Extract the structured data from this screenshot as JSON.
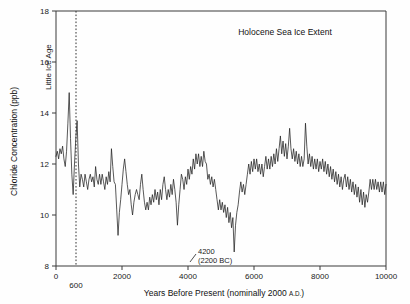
{
  "chart_data": {
    "type": "line",
    "title": "Holocene Sea Ice Extent",
    "xlabel": "Years Before Present (nominally 2000 A.D.)",
    "xlabel_main": "Years Before Present (nominally 2000 ",
    "xlabel_smallcaps": "A.D.",
    "xlabel_tail": ")",
    "ylabel": "Chloride Concentration (ppb)",
    "xlim": [
      0,
      10000
    ],
    "ylim": [
      8,
      18
    ],
    "xticks": [
      0,
      2000,
      4000,
      6000,
      8000,
      10000
    ],
    "xtick_labels": [
      "0",
      "2000",
      "4000",
      "6000",
      "8000",
      "10000"
    ],
    "yticks": [
      8,
      10,
      12,
      14,
      16,
      18
    ],
    "ytick_labels": [
      "8",
      "10",
      "12",
      "14",
      "16",
      "18"
    ],
    "grid": false,
    "legend": null,
    "series_name": "Chloride Concentration",
    "line_color": "#222222",
    "annotations": [
      {
        "name": "little-ice-age",
        "label": "Little Ice Age",
        "marker_x": 600,
        "marker_label": "600",
        "style": "vertical dotted line with rotated label"
      },
      {
        "name": "event-4200",
        "label_line1": "4200",
        "label_line2": "(2200 BC)",
        "point_x": 4200,
        "point_y": 8.55,
        "style": "leader line to minimum"
      }
    ],
    "x": [
      0,
      40,
      80,
      120,
      160,
      200,
      240,
      280,
      320,
      360,
      400,
      440,
      480,
      520,
      560,
      600,
      640,
      680,
      720,
      760,
      800,
      840,
      880,
      920,
      960,
      1000,
      1040,
      1080,
      1120,
      1160,
      1200,
      1240,
      1280,
      1320,
      1360,
      1400,
      1440,
      1480,
      1520,
      1560,
      1600,
      1640,
      1680,
      1720,
      1760,
      1800,
      1840,
      1880,
      1920,
      1960,
      2000,
      2040,
      2080,
      2120,
      2160,
      2200,
      2240,
      2280,
      2320,
      2360,
      2400,
      2440,
      2480,
      2520,
      2560,
      2600,
      2640,
      2680,
      2720,
      2760,
      2800,
      2840,
      2880,
      2920,
      2960,
      3000,
      3040,
      3080,
      3120,
      3160,
      3200,
      3240,
      3280,
      3320,
      3360,
      3400,
      3440,
      3480,
      3520,
      3560,
      3600,
      3640,
      3680,
      3720,
      3760,
      3800,
      3840,
      3880,
      3920,
      3960,
      4000,
      4040,
      4080,
      4120,
      4160,
      4200,
      4240,
      4280,
      4320,
      4360,
      4400,
      4440,
      4480,
      4520,
      4560,
      4600,
      4640,
      4680,
      4720,
      4760,
      4800,
      4840,
      4880,
      4920,
      4960,
      5000,
      5040,
      5080,
      5120,
      5160,
      5200,
      5240,
      5280,
      5320,
      5360,
      5400,
      5440,
      5480,
      5520,
      5560,
      5600,
      5640,
      5680,
      5720,
      5760,
      5800,
      5840,
      5880,
      5920,
      5960,
      6000,
      6040,
      6080,
      6120,
      6160,
      6200,
      6240,
      6280,
      6320,
      6360,
      6400,
      6440,
      6480,
      6520,
      6560,
      6600,
      6640,
      6680,
      6720,
      6760,
      6800,
      6840,
      6880,
      6920,
      6960,
      7000,
      7040,
      7080,
      7120,
      7160,
      7200,
      7240,
      7280,
      7320,
      7360,
      7400,
      7440,
      7480,
      7520,
      7560,
      7600,
      7640,
      7680,
      7720,
      7760,
      7800,
      7840,
      7880,
      7920,
      7960,
      8000,
      8040,
      8080,
      8120,
      8160,
      8200,
      8240,
      8280,
      8320,
      8360,
      8400,
      8440,
      8480,
      8520,
      8560,
      8600,
      8640,
      8680,
      8720,
      8760,
      8800,
      8840,
      8880,
      8920,
      8960,
      9000,
      9040,
      9080,
      9120,
      9160,
      9200,
      9240,
      9280,
      9320,
      9360,
      9400,
      9440,
      9480,
      9520,
      9560,
      9600,
      9640,
      9680,
      9720,
      9760,
      9800,
      9840,
      9880,
      9920,
      9960,
      10000
    ],
    "y": [
      12.3,
      12.5,
      12.2,
      12.6,
      12.4,
      12.7,
      12.2,
      11.9,
      12.5,
      13.6,
      14.8,
      13.0,
      11.6,
      10.8,
      12.0,
      13.0,
      13.7,
      12.0,
      11.1,
      11.6,
      11.4,
      11.1,
      11.6,
      11.3,
      11.0,
      11.4,
      11.6,
      11.3,
      11.5,
      11.1,
      11.9,
      11.4,
      11.2,
      11.6,
      11.2,
      11.6,
      11.3,
      11.0,
      11.5,
      11.2,
      11.7,
      11.3,
      12.6,
      11.9,
      11.3,
      11.2,
      10.2,
      9.2,
      10.1,
      10.6,
      11.2,
      11.8,
      12.2,
      11.7,
      11.2,
      10.8,
      11.0,
      10.4,
      10.0,
      10.5,
      10.8,
      11.0,
      10.8,
      10.6,
      11.2,
      11.6,
      11.0,
      10.5,
      10.2,
      10.5,
      10.2,
      10.7,
      10.4,
      10.8,
      10.5,
      11.0,
      10.6,
      10.9,
      10.4,
      11.0,
      10.6,
      11.2,
      11.5,
      11.0,
      10.6,
      11.0,
      10.7,
      11.2,
      10.8,
      11.4,
      11.0,
      10.5,
      9.6,
      10.4,
      11.0,
      11.6,
      11.4,
      11.0,
      11.5,
      11.2,
      11.8,
      11.4,
      11.9,
      11.6,
      12.2,
      11.8,
      12.4,
      12.0,
      12.4,
      11.9,
      12.3,
      11.9,
      12.5,
      12.1,
      12.0,
      11.4,
      11.6,
      11.2,
      11.5,
      11.1,
      11.4,
      11.0,
      10.6,
      10.2,
      10.6,
      10.2,
      10.5,
      10.1,
      10.4,
      9.9,
      10.3,
      9.7,
      10.1,
      9.5,
      9.9,
      8.55,
      9.6,
      10.1,
      10.4,
      10.9,
      11.3,
      10.9,
      11.2,
      10.8,
      11.2,
      11.6,
      12.0,
      11.6,
      12.1,
      11.7,
      12.2,
      11.8,
      12.2,
      11.7,
      12.0,
      11.6,
      12.0,
      11.5,
      11.9,
      12.3,
      11.8,
      12.2,
      11.8,
      12.3,
      11.9,
      12.4,
      12.0,
      12.6,
      12.1,
      12.6,
      13.1,
      12.4,
      12.9,
      12.3,
      12.8,
      12.2,
      12.7,
      13.4,
      12.6,
      12.2,
      12.6,
      12.1,
      12.5,
      12.0,
      12.4,
      11.9,
      12.3,
      11.9,
      12.2,
      13.6,
      12.7,
      12.0,
      12.4,
      11.9,
      12.3,
      11.8,
      12.2,
      11.8,
      12.2,
      11.7,
      12.1,
      11.8,
      12.2,
      11.7,
      12.1,
      11.6,
      12.0,
      11.5,
      11.9,
      11.4,
      11.8,
      11.3,
      11.7,
      11.2,
      11.6,
      11.1,
      11.5,
      11.0,
      11.4,
      11.6,
      11.1,
      11.5,
      11.0,
      11.4,
      10.9,
      11.3,
      10.8,
      11.2,
      10.7,
      11.1,
      10.5,
      11.0,
      10.4,
      10.9,
      10.3,
      10.8,
      10.5,
      10.9,
      11.4,
      11.0,
      11.4,
      11.0,
      11.4,
      11.0,
      11.3,
      10.9,
      11.3,
      10.9,
      11.3,
      10.8,
      11.2,
      11.5,
      11.0,
      11.4,
      10.9,
      11.4,
      11.0,
      11.5,
      11.1,
      11.6,
      11.1,
      11.6,
      11.2,
      11.7,
      11.3,
      11.8,
      11.3,
      11.8,
      11.4,
      11.8,
      11.4,
      11.9,
      11.4,
      11.9,
      11.5,
      12.0,
      11.5,
      12.0,
      11.6,
      12.1,
      11.6,
      12.1,
      11.7,
      12.2,
      11.7,
      12.2,
      11.8,
      12.3,
      11.8,
      12.3,
      11.9,
      12.4,
      11.9,
      12.4,
      12.0,
      12.5,
      12.0,
      12.5,
      12.1,
      12.6,
      12.1,
      12.6,
      12.2,
      12.7,
      12.2,
      12.7,
      12.3,
      12.8,
      12.3,
      12.8,
      12.4,
      12.9,
      12.4,
      12.9,
      12.5,
      13.0,
      12.5,
      13.0,
      12.6,
      13.1,
      12.6,
      12.4,
      12.8,
      12.5,
      12.9,
      12.6,
      13.0,
      12.7,
      13.2,
      12.9,
      13.4,
      13.0,
      13.6,
      13.2,
      13.0,
      13.4,
      13.1,
      12.8,
      13.2,
      12.9,
      12.6,
      12.9,
      12.5,
      12.1,
      12.4,
      12.0,
      11.7,
      11.9,
      11.6,
      11.3
    ]
  },
  "axes": {
    "plot_left_x": 56,
    "plot_right_x": 386,
    "plot_top_y": 11,
    "plot_bottom_y": 266
  }
}
